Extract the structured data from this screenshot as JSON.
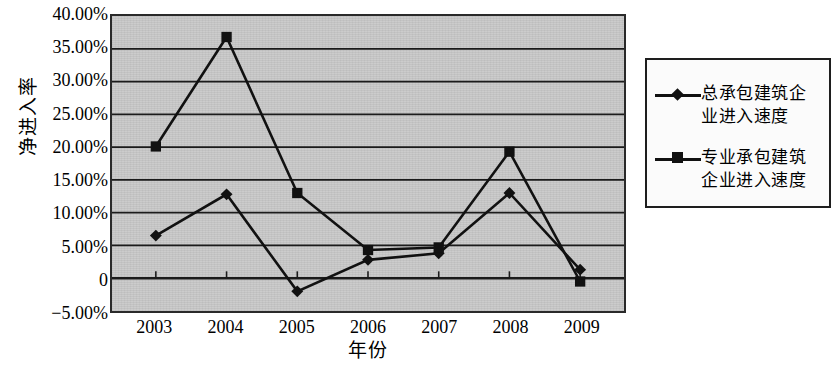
{
  "chart_data": {
    "type": "line",
    "title": "",
    "xlabel": "年份",
    "ylabel": "净进入率",
    "categories": [
      "2003",
      "2004",
      "2005",
      "2006",
      "2007",
      "2008",
      "2009"
    ],
    "x": [
      2003,
      2004,
      2005,
      2006,
      2007,
      2008,
      2009
    ],
    "ylim": [
      -5,
      40
    ],
    "ytick_values": [
      40,
      35,
      30,
      25,
      20,
      15,
      10,
      5,
      0,
      -5
    ],
    "ytick_labels": [
      "40.00%",
      "35.00%",
      "30.00%",
      "25.00%",
      "20.00%",
      "15.00%",
      "10.00%",
      "5.00%",
      "0",
      "−5.00%"
    ],
    "grid": true,
    "grid_axis": "y",
    "legend_position": "right",
    "plot_background": "#c9c9c9",
    "line_color": "#111111",
    "series": [
      {
        "name": "总承包建筑企业进入速度",
        "marker": "diamond",
        "values": [
          6.5,
          12.8,
          -2.0,
          2.8,
          3.8,
          13.0,
          1.3
        ]
      },
      {
        "name": "专业承包建筑企业进入速度",
        "marker": "square",
        "values": [
          20.1,
          36.8,
          13.0,
          4.3,
          4.7,
          19.3,
          -0.5
        ]
      }
    ]
  },
  "legend": {
    "entries": [
      {
        "label": "总承包建筑企\n业进入速度",
        "marker": "diamond"
      },
      {
        "label": "专业承包建筑\n企业进入速度",
        "marker": "square"
      }
    ]
  },
  "axis": {
    "y_title": "净进入率",
    "x_title": "年份"
  }
}
